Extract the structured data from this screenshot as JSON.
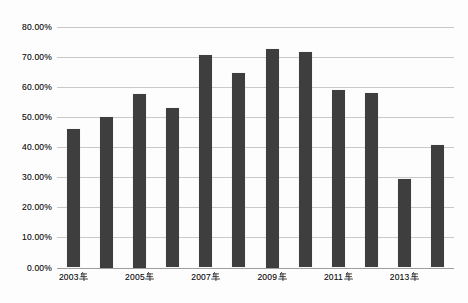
{
  "chart_data": {
    "type": "bar",
    "title": "",
    "categories": [
      "2003年",
      "2004年",
      "2005年",
      "2006年",
      "2007年",
      "2008年",
      "2009年",
      "2010年",
      "2011年",
      "2012年",
      "2013年",
      "2014年"
    ],
    "values": [
      46.0,
      50.0,
      57.5,
      53.0,
      70.5,
      64.5,
      72.5,
      71.5,
      59.0,
      58.0,
      29.5,
      40.5
    ],
    "value_unit": "%",
    "x_tick_labels": [
      "2003年",
      "2005年",
      "2007年",
      "2009年",
      "2011年",
      "2013年"
    ],
    "x_tick_step": 2,
    "y_tick_labels": [
      "0.00%",
      "10.00%",
      "20.00%",
      "30.00%",
      "40.00%",
      "50.00%",
      "60.00%",
      "70.00%",
      "80.00%"
    ],
    "ylim": [
      0,
      80
    ],
    "grid": "horizontal",
    "legend": "none",
    "colors": {
      "bar": "#3e3e3e",
      "gridline": "#c9c9c9",
      "axis_line": "#9e9e9e",
      "label": "#1a1a1a",
      "background": "#fdfdfd"
    }
  }
}
